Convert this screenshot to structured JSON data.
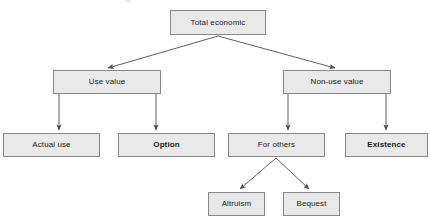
{
  "diagram": {
    "style": {
      "node_fill": "#e9e9e9",
      "node_border": "#888888",
      "edge_color": "#4d4d4d",
      "text_color": "#1a1a1a",
      "background": "#ffffff"
    },
    "nodes": [
      {
        "id": "total-economic",
        "label": "Total economic",
        "bold": false,
        "x": 170,
        "y": 10,
        "w": 96,
        "h": 25,
        "level": 0
      },
      {
        "id": "use-value",
        "label": "Use value",
        "bold": false,
        "x": 53,
        "y": 70,
        "w": 108,
        "h": 24,
        "level": 1
      },
      {
        "id": "non-use-value",
        "label": "Non-use value",
        "bold": false,
        "x": 283,
        "y": 70,
        "w": 108,
        "h": 24,
        "level": 1
      },
      {
        "id": "actual-use",
        "label": "Actual use",
        "bold": false,
        "x": 3,
        "y": 133,
        "w": 97,
        "h": 24,
        "level": 2
      },
      {
        "id": "option",
        "label": "Option",
        "bold": true,
        "x": 118,
        "y": 133,
        "w": 97,
        "h": 24,
        "level": 2
      },
      {
        "id": "for-others",
        "label": "For others",
        "bold": false,
        "x": 228,
        "y": 133,
        "w": 97,
        "h": 24,
        "level": 2
      },
      {
        "id": "existence",
        "label": "Existence",
        "bold": true,
        "x": 345,
        "y": 133,
        "w": 83,
        "h": 24,
        "level": 2
      },
      {
        "id": "altruism",
        "label": "Altruism",
        "bold": false,
        "x": 208,
        "y": 192,
        "w": 57,
        "h": 24,
        "level": 3
      },
      {
        "id": "bequest",
        "label": "Bequest",
        "bold": false,
        "x": 283,
        "y": 192,
        "w": 57,
        "h": 24,
        "level": 3
      }
    ],
    "edges": [
      {
        "id": "edge-total-to-use-value",
        "from": "total-economic",
        "to": "use-value",
        "kind": "diagonal-arrow"
      },
      {
        "id": "edge-total-to-non-use-value",
        "from": "total-economic",
        "to": "non-use-value",
        "kind": "diagonal-arrow"
      },
      {
        "id": "edge-use-value-to-actual-use",
        "from": "use-value",
        "to": "actual-use",
        "kind": "vertical-arrow"
      },
      {
        "id": "edge-use-value-to-option",
        "from": "use-value",
        "to": "option",
        "kind": "vertical-arrow"
      },
      {
        "id": "edge-non-use-value-to-for-others",
        "from": "non-use-value",
        "to": "for-others",
        "kind": "vertical-arrow"
      },
      {
        "id": "edge-non-use-value-to-existence",
        "from": "non-use-value",
        "to": "existence",
        "kind": "vertical-arrow"
      },
      {
        "id": "edge-for-others-to-altruism",
        "from": "for-others",
        "to": "altruism",
        "kind": "diagonal-arrow"
      },
      {
        "id": "edge-for-others-to-bequest",
        "from": "for-others",
        "to": "bequest",
        "kind": "diagonal-arrow"
      }
    ],
    "clipped_glyph": "o"
  }
}
